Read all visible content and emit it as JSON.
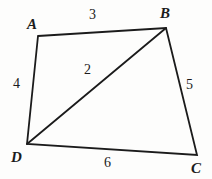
{
  "figure": {
    "type": "geometry-diagram",
    "shape": "quadrilateral-with-diagonal",
    "background_color": "#fdfdfc",
    "stroke_color": "#1b1b1b",
    "text_color": "#1b1b1b"
  },
  "vertices": [
    {
      "name": "A",
      "label": "A",
      "x": 38,
      "y": 36,
      "label_x": 27,
      "label_y": 17
    },
    {
      "name": "B",
      "label": "B",
      "x": 166,
      "y": 28,
      "label_x": 160,
      "label_y": 6
    },
    {
      "name": "C",
      "label": "C",
      "x": 197,
      "y": 155,
      "label_x": 191,
      "label_y": 161
    },
    {
      "name": "D",
      "label": "D",
      "x": 27,
      "y": 144,
      "label_x": 11,
      "label_y": 150
    }
  ],
  "edges": [
    {
      "name": "AB",
      "from": "A",
      "to": "B",
      "length_label": "3",
      "label_x": 89,
      "label_y": 8
    },
    {
      "name": "BC",
      "from": "B",
      "to": "C",
      "length_label": "5",
      "label_x": 186,
      "label_y": 78
    },
    {
      "name": "CD",
      "from": "C",
      "to": "D",
      "length_label": "6",
      "label_x": 104,
      "label_y": 156
    },
    {
      "name": "DA",
      "from": "D",
      "to": "A",
      "length_label": "4",
      "label_x": 13,
      "label_y": 77
    },
    {
      "name": "DB",
      "from": "D",
      "to": "B",
      "length_label": "2",
      "label_x": 84,
      "label_y": 63
    }
  ]
}
